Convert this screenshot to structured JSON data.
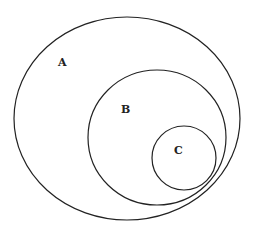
{
  "diagram": {
    "type": "venn-nested-sets",
    "stroke_color": "#222222",
    "background": "#ffffff",
    "sets": [
      {
        "label": "A",
        "shape": "ellipse",
        "cx": 127,
        "cy": 118.5,
        "rx": 113,
        "ry": 101.5,
        "label_x": 58,
        "label_y": 66
      },
      {
        "label": "B",
        "shape": "ellipse",
        "cx": 157,
        "cy": 137.5,
        "rx": 69,
        "ry": 67.5,
        "label_x": 121,
        "label_y": 113
      },
      {
        "label": "C",
        "shape": "circle",
        "cx": 184,
        "cy": 158,
        "rx": 32,
        "ry": 32,
        "label_x": 174,
        "label_y": 154
      }
    ],
    "relations": [
      "C ⊂ B",
      "B ⊂ A"
    ]
  }
}
